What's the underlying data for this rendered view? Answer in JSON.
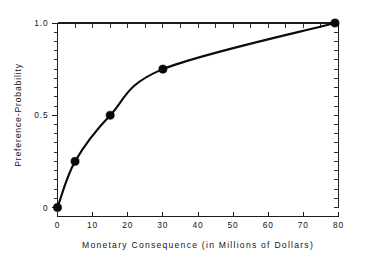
{
  "chart_data": {
    "type": "line",
    "title": "",
    "subtitle": "",
    "xlabel": "Monetary Consequence (in Millions of Dollars)",
    "ylabel": "Preference-Probability",
    "xlim": [
      0,
      80
    ],
    "ylim": [
      0,
      1.0
    ],
    "grid": false,
    "legend": null,
    "x_ticks": [
      0,
      10,
      20,
      30,
      40,
      50,
      60,
      70,
      80
    ],
    "x_tick_labels": [
      "0",
      "10",
      "20",
      "30",
      "40",
      "50",
      "60",
      "70",
      "80"
    ],
    "x_minor_step": 5,
    "y_ticks": [
      0,
      0.5,
      1.0
    ],
    "y_tick_labels": [
      "0",
      "0.5",
      "1.0"
    ],
    "y_minor_step": 0.05,
    "series": [
      {
        "name": "Utility curve",
        "marker": "filled-circle",
        "line_style": "solid",
        "color": "#0c0c0c",
        "x": [
          0,
          5,
          15,
          30,
          79
        ],
        "y": [
          0,
          0.25,
          0.5,
          0.75,
          1.0
        ]
      }
    ],
    "annotations": []
  },
  "figure": {
    "background_color": "#ffffff",
    "axis_color": "#1d1d1d",
    "curve_color": "#0c0c0c",
    "marker_color": "#0a0a0a"
  }
}
